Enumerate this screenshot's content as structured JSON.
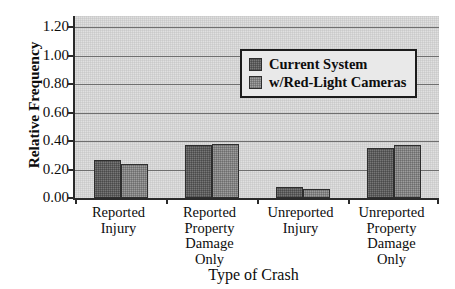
{
  "chart_data": {
    "type": "bar",
    "title": "",
    "xlabel": "Type of Crash",
    "ylabel": "Relative Frequency",
    "categories": [
      "Reported Injury",
      "Reported Property Damage Only",
      "Unreported Injury",
      "Unreported Property Damage Only"
    ],
    "category_lines": [
      [
        "Reported",
        "Injury"
      ],
      [
        "Reported",
        "Property",
        "Damage",
        "Only"
      ],
      [
        "Unreported",
        "Injury"
      ],
      [
        "Unreported",
        "Property",
        "Damage",
        "Only"
      ]
    ],
    "series": [
      {
        "name": "Current System",
        "values": [
          0.27,
          0.37,
          0.08,
          0.35
        ]
      },
      {
        "name": "w/Red-Light Cameras",
        "values": [
          0.24,
          0.38,
          0.06,
          0.37
        ]
      }
    ],
    "ylim": [
      0.0,
      1.28
    ],
    "yticks": [
      0.0,
      0.2,
      0.4,
      0.6,
      0.8,
      1.0,
      1.2
    ],
    "ytick_labels": [
      "0.00",
      "0.20",
      "0.40",
      "0.60",
      "0.80",
      "1.00",
      "1.20"
    ],
    "grid": true,
    "legend_position": "top-center",
    "colors": {
      "series_1": "#5d5d5d",
      "series_2": "#828282",
      "panel_background": "#d3d3d3",
      "gridline": "#6f6f6f",
      "axis": "#2b2b2b",
      "legend_background": "#e9e9e9"
    }
  }
}
